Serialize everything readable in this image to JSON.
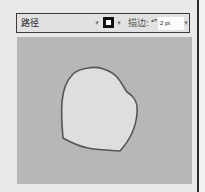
{
  "panel": {
    "title": "路径",
    "stroke_label": "描边:",
    "stroke_weight": "2 pt",
    "fill_dropdown_icon": "chevron-down-icon",
    "stroke_swatch_icon": "stroke-swatch-icon",
    "stepper_icon": "up-down-stepper-icon",
    "weight_dropdown_icon": "chevron-down-icon"
  },
  "glyphs": {
    "chevron": "▾",
    "stepper": "▴▾"
  },
  "colors": {
    "canvas_bg": "#b7b7b7",
    "shape_fill": "#dedede",
    "shape_stroke": "#555555",
    "swatch": "#111111"
  }
}
